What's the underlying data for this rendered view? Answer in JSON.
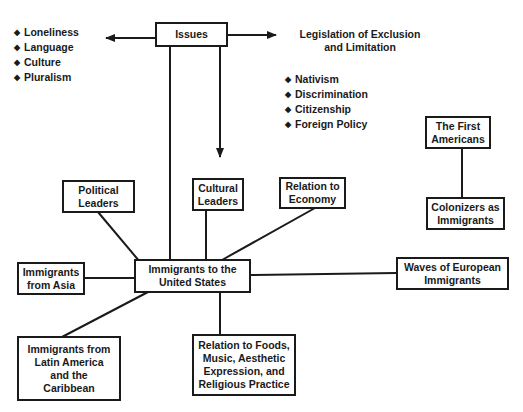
{
  "diagram": {
    "issues": {
      "label": "Issues"
    },
    "issues_list": {
      "items": [
        "Loneliness",
        "Language",
        "Culture",
        "Pluralism"
      ]
    },
    "legislation": {
      "label": "Legislation of Exclusion and Limitation",
      "line1": "Legislation of Exclusion",
      "line2": "and Limitation"
    },
    "legislation_list": {
      "items": [
        "Nativism",
        "Discrimination",
        "Citizenship",
        "Foreign Policy"
      ]
    },
    "bullet_glyph": "◆",
    "central": {
      "line1": "Immigrants to the",
      "line2": "United States"
    },
    "political_leaders": {
      "line1": "Political",
      "line2": "Leaders"
    },
    "cultural_leaders": {
      "line1": "Cultural",
      "line2": "Leaders"
    },
    "economy": {
      "line1": "Relation to",
      "line2": "Economy"
    },
    "asia": {
      "line1": "Immigrants",
      "line2": "from Asia"
    },
    "european": {
      "line1": "Waves of European",
      "line2": "Immigrants"
    },
    "latin": {
      "line1": "Immigrants from",
      "line2": "Latin America",
      "line3": "and the",
      "line4": "Caribbean"
    },
    "foods": {
      "line1": "Relation to Foods,",
      "line2": "Music, Aesthetic",
      "line3": "Expression, and",
      "line4": "Religious Practice"
    },
    "first_americans": {
      "line1": "The First",
      "line2": "Americans"
    },
    "colonizers": {
      "line1": "Colonizers as",
      "line2": "Immigrants"
    }
  }
}
